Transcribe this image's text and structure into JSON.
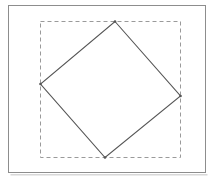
{
  "figure": {
    "title": "Rotated square inscribed in its axis-aligned bounding box",
    "canvas": {
      "width": 214,
      "height": 183,
      "background": "#ffffff"
    },
    "outer_frame": {
      "name": "outer-frame",
      "x": 8.5,
      "y": 5.5,
      "width": 197,
      "height": 167,
      "stroke": "#8d8d8d",
      "stroke_width": 1,
      "fill": "#ffffff",
      "style": "solid"
    },
    "frame_shadow": {
      "name": "frame-drop-shadow",
      "x": 10.5,
      "y": 174,
      "width": 197,
      "height": 1.5,
      "fill": "#d8d8d8"
    },
    "bounding_box": {
      "name": "dashed-bounding-box",
      "x": 40.5,
      "y": 21.5,
      "width": 140,
      "height": 136,
      "stroke": "#9a9a9a",
      "stroke_width": 1,
      "fill": "none",
      "style": "dashed",
      "dash_pattern": "4 3"
    },
    "rotated_square": {
      "name": "rotated-square",
      "stroke": "#555555",
      "stroke_width": 1.1,
      "fill": "none",
      "style": "solid",
      "rotation_degrees": 37,
      "vertices": [
        {
          "label": "top",
          "x": 115,
          "y": 21.5
        },
        {
          "label": "right",
          "x": 180.5,
          "y": 96
        },
        {
          "label": "bottom",
          "x": 105,
          "y": 157.5
        },
        {
          "label": "left",
          "x": 40.5,
          "y": 84
        }
      ],
      "points_attr": "115,21.5 180.5,96 105,157.5 40.5,84"
    },
    "vertex_markers": [
      {
        "name": "vertex-top",
        "x": 115,
        "y": 21.5,
        "r": 1.3,
        "fill": "#555555"
      },
      {
        "name": "vertex-right",
        "x": 180.5,
        "y": 96,
        "r": 1.3,
        "fill": "#555555"
      },
      {
        "name": "vertex-bottom",
        "x": 105,
        "y": 157.5,
        "r": 1.3,
        "fill": "#555555"
      },
      {
        "name": "vertex-left",
        "x": 40.5,
        "y": 84,
        "r": 1.3,
        "fill": "#555555"
      }
    ]
  }
}
